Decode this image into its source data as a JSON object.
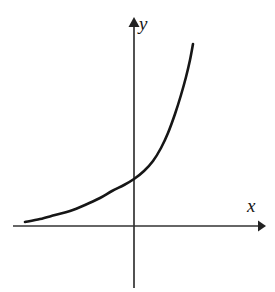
{
  "figure": {
    "kind": "math-graph",
    "background_color": "#ffffff",
    "ink_color": "#161616",
    "width": 275,
    "height": 292
  },
  "axes": {
    "x_axis": {
      "label": "x",
      "arrow": "arrow-right",
      "color": "#333333",
      "y_position": 226,
      "x_start": 13,
      "x_end": 266
    },
    "y_axis": {
      "label": "y",
      "arrow": "arrow-up",
      "color": "#333333",
      "x_position": 134,
      "y_top": 18,
      "y_bottom": 288
    },
    "origin": {
      "x": 134,
      "y": 226
    }
  },
  "curve": {
    "name": "exponential-curve",
    "color": "#161616",
    "stroke_width": 2.6,
    "description": "increasing exponential curve, concave up, asymptotic to the x-axis on the left"
  },
  "chart_data": {
    "type": "line",
    "title": "",
    "subtitle": "",
    "xlabel": "x",
    "ylabel": "y",
    "grid": false,
    "legend": null,
    "axis_arrows": true,
    "series": [
      {
        "name": "exponential-curve",
        "color": "#161616",
        "points_px": [
          [
            25,
            222
          ],
          [
            40,
            219
          ],
          [
            55,
            215
          ],
          [
            70,
            211
          ],
          [
            85,
            205
          ],
          [
            100,
            198
          ],
          [
            112,
            191
          ],
          [
            124,
            185
          ],
          [
            134,
            179
          ],
          [
            144,
            171
          ],
          [
            153,
            161
          ],
          [
            161,
            148
          ],
          [
            168,
            133
          ],
          [
            175,
            114
          ],
          [
            181,
            95
          ],
          [
            186,
            77
          ],
          [
            190,
            60
          ],
          [
            193,
            44
          ]
        ],
        "points_axis": [
          [
            -3.0,
            0.08
          ],
          [
            -2.6,
            0.12
          ],
          [
            -2.2,
            0.17
          ],
          [
            -1.8,
            0.23
          ],
          [
            -1.4,
            0.32
          ],
          [
            -1.0,
            0.44
          ],
          [
            -0.6,
            0.56
          ],
          [
            -0.3,
            0.66
          ],
          [
            0.0,
            0.77
          ],
          [
            0.3,
            0.92
          ],
          [
            0.5,
            1.1
          ],
          [
            0.75,
            1.35
          ],
          [
            1.0,
            1.65
          ],
          [
            1.2,
            2.05
          ],
          [
            1.45,
            2.45
          ],
          [
            1.65,
            2.85
          ],
          [
            1.8,
            3.25
          ],
          [
            2.0,
            3.6
          ]
        ],
        "xlim_px": [
          25,
          193
        ],
        "ylim_px": [
          222,
          44
        ]
      }
    ]
  }
}
